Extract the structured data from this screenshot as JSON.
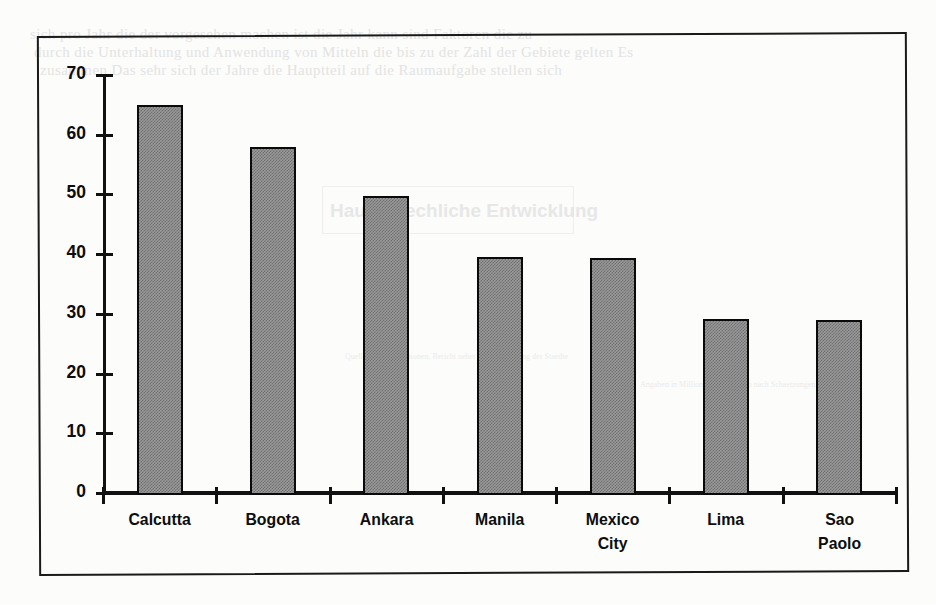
{
  "chart_data": {
    "type": "bar",
    "title": "",
    "subtitle": "",
    "xlabel": "",
    "ylabel": "",
    "categories": [
      "Calcutta",
      "Bogota",
      "Ankara",
      "Manila",
      "Mexico City",
      "Lima",
      "Sao Paolo"
    ],
    "values": [
      65,
      58,
      49.7,
      39.5,
      39.3,
      29.2,
      29
    ],
    "ylim": [
      0,
      70
    ],
    "ytick_labels": [
      "0",
      "10",
      "20",
      "30",
      "40",
      "50",
      "60",
      "70"
    ],
    "ytick_values": [
      0,
      10,
      20,
      30,
      40,
      50,
      60,
      70
    ],
    "grid": false,
    "legend": null,
    "bar_fill_color": "#9a9a9a",
    "bar_edge_color": "#0a0a0a",
    "axis_color": "#111111",
    "background_color": "#fcfcfb"
  },
  "category_lines": [
    [
      "Calcutta"
    ],
    [
      "Bogota"
    ],
    [
      "Ankara"
    ],
    [
      "Manila"
    ],
    [
      "Mexico",
      "City"
    ],
    [
      "Lima"
    ],
    [
      "Sao",
      "Paolo"
    ]
  ],
  "bleed_through": {
    "line1": "sich  pro  Jahr  die  der  vorgesehen  machen  ist   die   Jahr  kann  sind  Faktoren  die  zu",
    "line2": "durch die Unterhaltung  und Anwendung  von Mitteln  die bis zu  der  Zahl  der  Gebiete  gelten  Es",
    "line3": "zusammen  Das  sehr  sich   der    Jahre   die   Hauptteil  auf  die  Raumaufgabe  stellen  sich",
    "band": "Hauptsaechliche  Entwicklung",
    "small1": "Quelle: Vereinte Nationen, Bericht ueber die Entwicklung der Staedte",
    "small2": "Angaben in Millionen Einwohnern nach Schaetzungen"
  }
}
